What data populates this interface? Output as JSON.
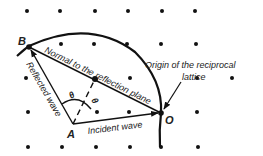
{
  "diagram": {
    "type": "ewald-sphere-construction",
    "labels": {
      "point_b": "B",
      "point_a": "A",
      "point_o": "O",
      "theta_1": "θ",
      "theta_2": "θ",
      "normal_label": "Normal to the reflection plane",
      "reflected_label": "Reflected wave",
      "incident_label": "Incident wave",
      "origin_label_line1": "Origin of the reciprocal",
      "origin_label_line2": "lattice"
    },
    "colors": {
      "ink": "#111111",
      "text": "#222222",
      "background": "#ffffff"
    },
    "lattice_points": [
      [
        27,
        11
      ],
      [
        60,
        11
      ],
      [
        95,
        11
      ],
      [
        128,
        11
      ],
      [
        162,
        11
      ],
      [
        195,
        11
      ],
      [
        61,
        44
      ],
      [
        94,
        44
      ],
      [
        127,
        44
      ],
      [
        161,
        44
      ],
      [
        196,
        44
      ],
      [
        26,
        78
      ],
      [
        130,
        78
      ],
      [
        163,
        78
      ],
      [
        197,
        78
      ],
      [
        232,
        78
      ],
      [
        28,
        112
      ],
      [
        97,
        112
      ],
      [
        129,
        112
      ],
      [
        197,
        112
      ],
      [
        28,
        147
      ],
      [
        62,
        147
      ],
      [
        96,
        147
      ],
      [
        130,
        147
      ],
      [
        161,
        147
      ],
      [
        198,
        147
      ]
    ]
  }
}
